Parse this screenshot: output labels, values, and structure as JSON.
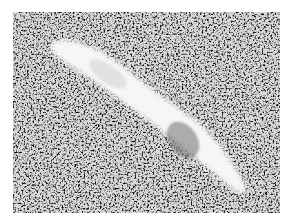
{
  "image": {
    "description": "Grayscale micrograph of densely speckled tissue with an elongated pale diagonal structure",
    "colors": {
      "background": "#ffffff",
      "tissue_dark": "#3a3a3a",
      "tissue_mid": "#8a8a8a",
      "lumen": "#f4f4f4",
      "inner_shadow": "#6e6e6e"
    }
  }
}
